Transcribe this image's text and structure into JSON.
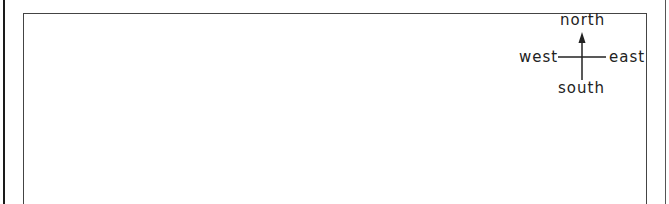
{
  "diagram": {
    "type": "compass-rose",
    "labels": {
      "north": "north",
      "south": "south",
      "east": "east",
      "west": "west"
    },
    "colors": {
      "line": "#222222",
      "frame": "#444444",
      "background": "#ffffff"
    }
  }
}
